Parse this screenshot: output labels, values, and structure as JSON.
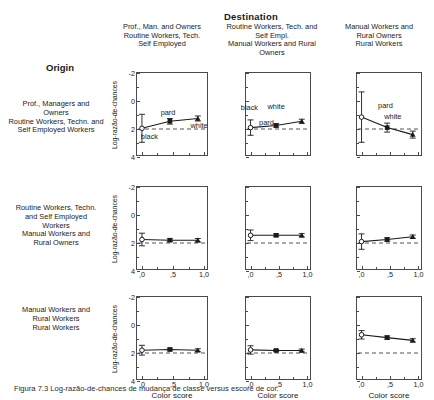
{
  "figure": {
    "destination_title": "Destination",
    "origin_title": "Origin",
    "caption": "Figura 7.3 Log-razão-de-chances de mudança de classe versus escore de cor.",
    "y_axis_label": "Log-razão-de-chances",
    "x_axis_label": "Color score",
    "y_ticks": [
      "4",
      "2",
      "0",
      "-2"
    ],
    "x_ticks": [
      ",0",
      ",5",
      "1,0"
    ],
    "reference_line_value": "0",
    "colors": {
      "axis": "#4a4a4a",
      "series": "#1a1a1a",
      "reference": "#555555",
      "text": "#1a1a1a"
    }
  },
  "columns": [
    {
      "label": "Prof., Man. and Owners\nRoutine Workers, Tech.\nSelf Employed"
    },
    {
      "label": "Routine Workers, Tech. and Self Empl.\nManual Workers and Rural Owners"
    },
    {
      "label": "Manual Workers and\nRural Owners\nRural Workers"
    }
  ],
  "rows": [
    {
      "label": "Prof., Managers and\nOwners\nRoutine Workers, Techn. and\nSelf Employed Workers"
    },
    {
      "label": "Routine Workers, Techn.\nand Self Employed\nWorkers\nManual Workers and\nRural Owners"
    },
    {
      "label": "Manual Workers and\nRural Workers\nRural Workers"
    }
  ],
  "chart_data": {
    "type": "line",
    "title": "Log-razão-de-chances de mudança de classe versus escore de cor",
    "xlabel": "Color score",
    "ylabel": "Log-razão-de-chances",
    "xlim": [
      -0.08,
      1.08
    ],
    "ylim": [
      -2,
      4
    ],
    "xticks": [
      0.0,
      0.5,
      1.0
    ],
    "yticks": [
      -2,
      0,
      2,
      4
    ],
    "grid": false,
    "legend": "inline point labels",
    "reference_line": {
      "y": 0,
      "style": "dashed"
    },
    "point_labels": [
      "black",
      "pard",
      "white"
    ],
    "panels": [
      {
        "row": 0,
        "col": 0,
        "row_label": "Prof., Managers and Owners / Routine Workers, Techn. and Self Employed Workers",
        "col_label": "Prof., Man. and Owners / Routine Workers, Tech. Self Employed",
        "x": [
          0.0,
          0.45,
          0.9
        ],
        "y": [
          0.05,
          0.55,
          0.75
        ],
        "yerr": [
          1.0,
          0.2,
          0.18
        ],
        "markers": [
          "open-circle",
          "filled-square",
          "filled-triangle"
        ],
        "labels": [
          {
            "text": "black",
            "x": 0.12,
            "y": -0.55
          },
          {
            "text": "pard",
            "x": 0.42,
            "y": 1.15
          },
          {
            "text": "white",
            "x": 0.92,
            "y": 0.25
          }
        ]
      },
      {
        "row": 0,
        "col": 1,
        "row_label": "Prof., Managers and Owners / Routine Workers, Techn. and Self Employed Workers",
        "col_label": "Routine Workers, Tech. and Self Empl. / Manual Workers and Rural Owners",
        "x": [
          0.0,
          0.45,
          0.9
        ],
        "y": [
          0.1,
          0.25,
          0.55
        ],
        "yerr": [
          0.55,
          0.12,
          0.15
        ],
        "markers": [
          "open-circle",
          "filled-square",
          "filled-triangle"
        ],
        "labels": [
          {
            "text": "black",
            "x": -0.02,
            "y": 1.5
          },
          {
            "text": "pard",
            "x": 0.28,
            "y": 0.45
          },
          {
            "text": "white",
            "x": 0.45,
            "y": 1.55
          }
        ]
      },
      {
        "row": 0,
        "col": 2,
        "row_label": "Prof., Managers and Owners / Routine Workers, Techn. and Self Employed Workers",
        "col_label": "Manual Workers and Rural Owners / Rural Workers",
        "x": [
          0.0,
          0.45,
          0.9
        ],
        "y": [
          0.85,
          0.1,
          -0.4
        ],
        "yerr": [
          1.8,
          0.32,
          0.25
        ],
        "markers": [
          "open-circle",
          "filled-square",
          "filled-triangle"
        ],
        "labels": [
          {
            "text": "pard",
            "x": 0.42,
            "y": 1.65
          },
          {
            "text": "white",
            "x": 0.55,
            "y": 0.85
          }
        ]
      },
      {
        "row": 1,
        "col": 0,
        "row_label": "Routine Workers, Techn. and Self Employed Workers / Manual Workers and Rural Owners",
        "col_label": "Prof., Man. and Owners / Routine Workers, Tech. Self Employed",
        "x": [
          0.0,
          0.45,
          0.9
        ],
        "y": [
          0.25,
          0.2,
          0.2
        ],
        "yerr": [
          0.45,
          0.1,
          0.12
        ],
        "markers": [
          "open-circle",
          "filled-square",
          "filled-triangle"
        ],
        "labels": []
      },
      {
        "row": 1,
        "col": 1,
        "row_label": "Routine Workers, Techn. and Self Employed Workers / Manual Workers and Rural Owners",
        "col_label": "Routine Workers, Tech. and Self Empl. / Manual Workers and Rural Owners",
        "x": [
          0.0,
          0.45,
          0.9
        ],
        "y": [
          0.55,
          0.55,
          0.55
        ],
        "yerr": [
          0.38,
          0.1,
          0.12
        ],
        "markers": [
          "open-circle",
          "filled-square",
          "filled-triangle"
        ],
        "labels": []
      },
      {
        "row": 1,
        "col": 2,
        "row_label": "Routine Workers, Techn. and Self Employed Workers / Manual Workers and Rural Owners",
        "col_label": "Manual Workers and Rural Owners / Rural Workers",
        "x": [
          0.0,
          0.45,
          0.9
        ],
        "y": [
          0.1,
          0.25,
          0.45
        ],
        "yerr": [
          0.55,
          0.12,
          0.12
        ],
        "markers": [
          "open-circle",
          "filled-square",
          "filled-triangle"
        ],
        "labels": []
      },
      {
        "row": 2,
        "col": 0,
        "row_label": "Manual Workers and Rural Workers / Rural Workers",
        "col_label": "Prof., Man. and Owners / Routine Workers, Tech. Self Employed",
        "x": [
          0.0,
          0.45,
          0.9
        ],
        "y": [
          0.2,
          0.25,
          0.2
        ],
        "yerr": [
          0.35,
          0.1,
          0.1
        ],
        "markers": [
          "open-circle",
          "filled-square",
          "filled-triangle"
        ],
        "labels": []
      },
      {
        "row": 2,
        "col": 1,
        "row_label": "Manual Workers and Rural Workers / Rural Workers",
        "col_label": "Routine Workers, Tech. and Self Empl. / Manual Workers and Rural Owners",
        "x": [
          0.0,
          0.45,
          0.9
        ],
        "y": [
          0.22,
          0.18,
          0.18
        ],
        "yerr": [
          0.3,
          0.08,
          0.1
        ],
        "markers": [
          "open-circle",
          "filled-square",
          "filled-triangle"
        ],
        "labels": []
      },
      {
        "row": 2,
        "col": 2,
        "row_label": "Manual Workers and Rural Workers / Rural Workers",
        "col_label": "Manual Workers and Rural Owners / Rural Workers",
        "x": [
          0.0,
          0.45,
          0.9
        ],
        "y": [
          1.3,
          1.1,
          0.9
        ],
        "yerr": [
          0.3,
          0.12,
          0.12
        ],
        "markers": [
          "open-circle",
          "filled-square",
          "filled-triangle"
        ],
        "labels": []
      }
    ]
  }
}
